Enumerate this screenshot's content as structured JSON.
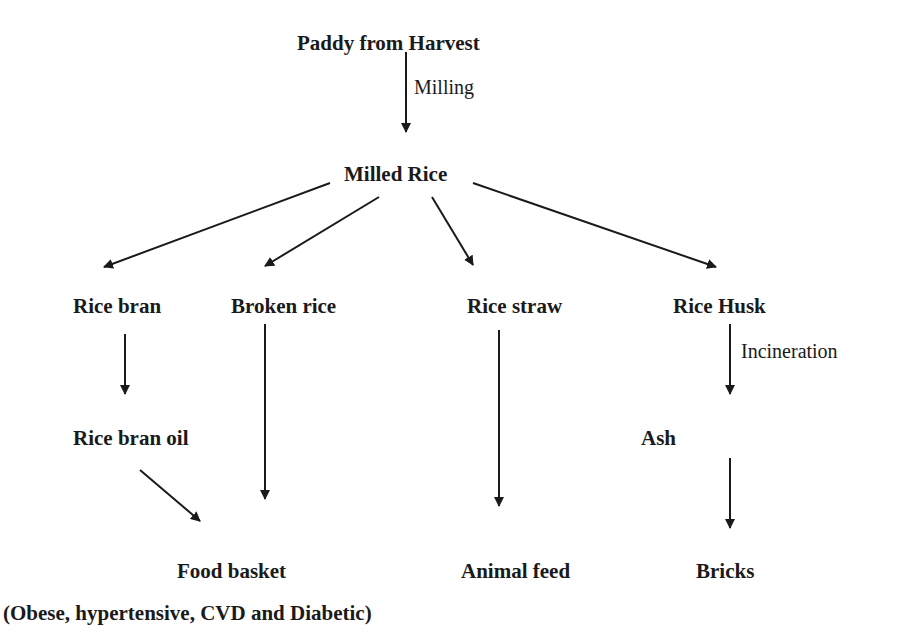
{
  "diagram": {
    "type": "flowchart",
    "nodes": {
      "paddy": "Paddy from Harvest",
      "milled_rice": "Milled Rice",
      "rice_bran": "Rice bran",
      "broken_rice": "Broken rice",
      "rice_straw": "Rice straw",
      "rice_husk": "Rice Husk",
      "rice_bran_oil": "Rice bran oil",
      "ash": "Ash",
      "food_basket": "Food basket",
      "food_basket_note": "(Obese, hypertensive, CVD and Diabetic)",
      "animal_feed": "Animal feed",
      "bricks": "Bricks"
    },
    "edge_labels": {
      "milling": "Milling",
      "incineration": "Incineration"
    },
    "edges": [
      {
        "from": "Paddy from Harvest",
        "to": "Milled Rice",
        "label": "Milling"
      },
      {
        "from": "Milled Rice",
        "to": "Rice bran"
      },
      {
        "from": "Milled Rice",
        "to": "Broken rice"
      },
      {
        "from": "Milled Rice",
        "to": "Rice straw"
      },
      {
        "from": "Milled Rice",
        "to": "Rice Husk"
      },
      {
        "from": "Rice bran",
        "to": "Rice bran oil"
      },
      {
        "from": "Rice bran oil",
        "to": "Food basket"
      },
      {
        "from": "Broken rice",
        "to": "Food basket"
      },
      {
        "from": "Rice straw",
        "to": "Animal feed"
      },
      {
        "from": "Rice Husk",
        "to": "Ash",
        "label": "Incineration"
      },
      {
        "from": "Ash",
        "to": "Bricks"
      }
    ],
    "colors": {
      "ink": "#1a1a1a",
      "background": "#ffffff"
    }
  }
}
